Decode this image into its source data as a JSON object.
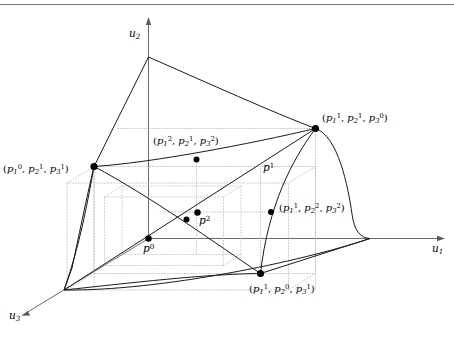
{
  "figure": {
    "kind": "3d-utility-possibility-frontier",
    "background_color": "#ffffff",
    "line_color": "#1a1a1a",
    "dotted_color": "#b0b0b0",
    "axis_color": "#555555",
    "top_rule_color": "#808080",
    "width": 454,
    "height": 340
  },
  "axes": [
    {
      "id": "u1",
      "name": "u-one-axis",
      "label_main": "u",
      "label_sub": "1",
      "x": 432,
      "y": 246
    },
    {
      "id": "u2",
      "name": "u-two-axis",
      "label_main": "u",
      "label_sub": "2",
      "x": 129,
      "y": 28
    },
    {
      "id": "u3",
      "name": "u-three-axis",
      "label_main": "u",
      "label_sub": "3",
      "x": 10,
      "y": 312
    }
  ],
  "vertex_labels": [
    {
      "id": "v-110",
      "name": "vertex-label-p1-p2-p3-upper-right",
      "text": "(p₁¹, p₂¹, p₃⁰)",
      "components": [
        {
          "base": "p",
          "sub": "1",
          "sup": "1"
        },
        {
          "base": "p",
          "sub": "2",
          "sup": "1"
        },
        {
          "base": "p",
          "sub": "3",
          "sup": "0"
        }
      ],
      "x": 322,
      "y": 114
    },
    {
      "id": "v-011",
      "name": "vertex-label-p1-p2-p3-left",
      "text": "(p₁⁰, p₂¹, p₃¹)",
      "components": [
        {
          "base": "p",
          "sub": "1",
          "sup": "0"
        },
        {
          "base": "p",
          "sub": "2",
          "sup": "1"
        },
        {
          "base": "p",
          "sub": "3",
          "sup": "1"
        }
      ],
      "x": 3,
      "y": 165
    },
    {
      "id": "v-101",
      "name": "vertex-label-p1-p2-p3-bottom",
      "text": "(p₁¹, p₂⁰, p₃¹)",
      "components": [
        {
          "base": "p",
          "sub": "1",
          "sup": "1"
        },
        {
          "base": "p",
          "sub": "2",
          "sup": "0"
        },
        {
          "base": "p",
          "sub": "3",
          "sup": "1"
        }
      ],
      "x": 249,
      "y": 285
    },
    {
      "id": "v-212",
      "name": "vertex-label-p1-p2-p3-center",
      "text": "(p₁², p₂¹, p₃²)",
      "components": [
        {
          "base": "p",
          "sub": "1",
          "sup": "2"
        },
        {
          "base": "p",
          "sub": "2",
          "sup": "1"
        },
        {
          "base": "p",
          "sub": "3",
          "sup": "2"
        }
      ],
      "x": 153,
      "y": 137
    },
    {
      "id": "v-122",
      "name": "vertex-label-p1-p2-p3-right-mid",
      "text": "(p₁¹, p₂², p₃²)",
      "components": [
        {
          "base": "p",
          "sub": "1",
          "sup": "1"
        },
        {
          "base": "p",
          "sub": "2",
          "sup": "2"
        },
        {
          "base": "p",
          "sub": "3",
          "sup": "2"
        }
      ],
      "x": 279,
      "y": 204
    }
  ],
  "point_labels": [
    {
      "id": "p0",
      "name": "point-label-p0",
      "base": "p",
      "sup": "0",
      "x": 143,
      "y": 244
    },
    {
      "id": "p1",
      "name": "point-label-p1",
      "base": "p",
      "sup": "1",
      "x": 263,
      "y": 163
    },
    {
      "id": "p2",
      "name": "point-label-p2",
      "base": "p",
      "sup": "2",
      "x": 199,
      "y": 216
    }
  ],
  "marked_points": [
    {
      "name": "dot-origin-p0",
      "x": 148.5,
      "y": 238.5,
      "r": 3.2
    },
    {
      "name": "dot-vertex-110",
      "x": 315.5,
      "y": 128.5,
      "r": 3.4
    },
    {
      "name": "dot-vertex-011",
      "x": 94.0,
      "y": 166.5,
      "r": 3.4
    },
    {
      "name": "dot-vertex-101",
      "x": 260.5,
      "y": 273.5,
      "r": 3.4
    },
    {
      "name": "dot-vertex-212",
      "x": 196.5,
      "y": 159.5,
      "r": 3.0
    },
    {
      "name": "dot-vertex-122",
      "x": 271.0,
      "y": 212.0,
      "r": 3.0
    },
    {
      "name": "dot-interior-p2",
      "x": 197.5,
      "y": 212.5,
      "r": 3.2
    },
    {
      "name": "dot-interior-lower",
      "x": 186.5,
      "y": 219.5,
      "r": 3.0
    }
  ]
}
